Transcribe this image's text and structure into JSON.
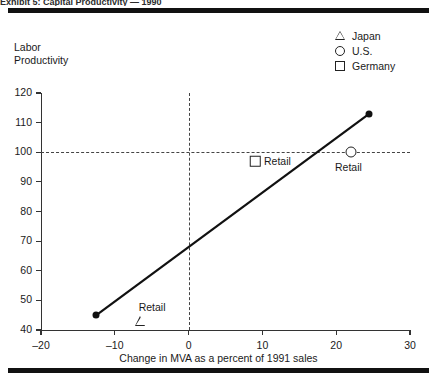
{
  "header": {
    "clipped_text": "Exhibit 5: Capital Productivity — 1990"
  },
  "chart_data": {
    "type": "scatter",
    "title": "",
    "xlabel": "Change in MVA as a percent of 1991 sales",
    "ylabel": "Labor Productivity",
    "xlim": [
      -20,
      30
    ],
    "ylim": [
      40,
      120
    ],
    "xticks": [
      -20,
      -10,
      0,
      10,
      20,
      30
    ],
    "xtick_labels": [
      "–20",
      "–10",
      "0",
      "10",
      "20",
      "30"
    ],
    "yticks": [
      40,
      50,
      60,
      70,
      80,
      90,
      100,
      110,
      120
    ],
    "ytick_labels": [
      "40",
      "50",
      "60",
      "70",
      "80",
      "90",
      "100",
      "110",
      "120"
    ],
    "grid": false,
    "reference_lines": [
      {
        "name": "y-100-reference",
        "orient": "horizontal",
        "value": 100,
        "style": "dashed"
      },
      {
        "name": "x-zero-reference",
        "orient": "vertical",
        "value": 0,
        "style": "dashed"
      }
    ],
    "trend_line": {
      "name": "regression-line",
      "x": [
        -12.5,
        24.5
      ],
      "y": [
        45,
        113
      ],
      "endpoint_markers": "filled-dot"
    },
    "legend": {
      "position": "top-right",
      "entries": [
        {
          "label": "Japan",
          "marker": "triangle"
        },
        {
          "label": "U.S.",
          "marker": "circle"
        },
        {
          "label": "Germany",
          "marker": "square"
        }
      ]
    },
    "series": [
      {
        "name": "Japan",
        "marker": "triangle",
        "points": [
          {
            "label": "Retail",
            "x": -6.5,
            "y": 43
          }
        ]
      },
      {
        "name": "U.S.",
        "marker": "circle",
        "points": [
          {
            "label": "Retail",
            "x": 22.0,
            "y": 100
          }
        ]
      },
      {
        "name": "Germany",
        "marker": "square",
        "points": [
          {
            "label": "Retail",
            "x": 9.0,
            "y": 97
          }
        ]
      }
    ],
    "point_labels": [
      "Retail",
      "Retail",
      "Retail"
    ]
  }
}
